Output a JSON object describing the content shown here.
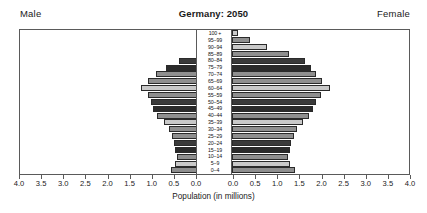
{
  "header": {
    "left_label": "Male",
    "right_label": "Female",
    "title": "Germany: 2050"
  },
  "axis": {
    "title": "Population (in millions)",
    "left_ticks": [
      "4.0",
      "3.5",
      "3.0",
      "2.5",
      "2.0",
      "1.5",
      "1.0",
      "0.5",
      "0.0"
    ],
    "right_ticks": [
      "0.0",
      "0.5",
      "1.0",
      "1.5",
      "2.0",
      "2.5",
      "3.0",
      "3.5",
      "4.0"
    ],
    "max": 4.0,
    "step": 0.5
  },
  "chart_data": {
    "type": "bar",
    "title": "Germany: 2050",
    "xlabel": "Population (in millions)",
    "ylabel": "",
    "xlim": [
      0,
      4.0
    ],
    "grid": false,
    "legend": [
      "Male",
      "Female"
    ],
    "legend_position": "top-corners",
    "categories": [
      "100 +",
      "95–99",
      "90–94",
      "85–89",
      "80–84",
      "75–79",
      "70–74",
      "65–69",
      "60–64",
      "55–59",
      "50–54",
      "45–49",
      "40–44",
      "35–39",
      "30–34",
      "25–29",
      "20–24",
      "15–19",
      "10–14",
      "5–9",
      "0–4"
    ],
    "series": [
      {
        "name": "Male",
        "side": "left",
        "values": [
          0.05,
          0.18,
          0.42,
          0.78,
          1.22,
          1.52,
          1.74,
          1.92,
          2.08,
          1.92,
          1.86,
          1.8,
          1.72,
          1.56,
          1.44,
          1.38,
          1.34,
          1.3,
          1.26,
          1.3,
          1.4
        ]
      },
      {
        "name": "Female",
        "side": "right",
        "values": [
          0.14,
          0.4,
          0.8,
          1.28,
          1.66,
          1.78,
          1.9,
          2.04,
          2.22,
          2.0,
          1.9,
          1.84,
          1.74,
          1.6,
          1.48,
          1.4,
          1.34,
          1.3,
          1.26,
          1.3,
          1.42
        ]
      }
    ],
    "shades": [
      "light",
      "mid",
      "light",
      "mid",
      "dark",
      "vdark",
      "mid",
      "mid",
      "light",
      "mid",
      "dark",
      "vdark",
      "mid",
      "light",
      "mid",
      "mid",
      "dark",
      "vdark",
      "mid",
      "light",
      "mid"
    ]
  },
  "colors": {
    "frame": "#5a5a5a",
    "bar_outline": "#2a2a2a",
    "shade_light": "#c9c9c9",
    "shade_mid": "#8f8f8f",
    "shade_dark": "#3a3a3a",
    "shade_vdark": "#2b2b2b",
    "background": "#ffffff"
  }
}
